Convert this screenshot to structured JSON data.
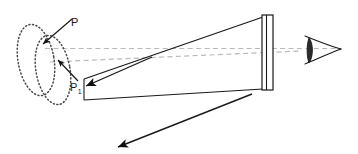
{
  "figure": {
    "kind": "optics-ray-diagram",
    "width": 358,
    "height": 154,
    "background_color": "#ffffff",
    "stroke_color": "#1a1a1a",
    "dashed_axis_color": "#b4b4b4",
    "dotted_ellipse_color": "#4d4d4d"
  },
  "labels": {
    "point_p": "P",
    "point_p1_base": "P",
    "point_p1_subscript": "1"
  },
  "elements": {
    "ellipse_back_name": "back wavefront ellipse",
    "ellipse_front_name": "front wavefront ellipse",
    "cone_name": "light cone",
    "screen_name": "screen plate",
    "eye_name": "observer eye",
    "ray_upper_name": "upper ray arrow",
    "ray_lower_name": "lower ray arrow",
    "axis_upper_name": "upper optical axis",
    "axis_lower_name": "lower optical axis",
    "pointer_p_name": "pointer to P",
    "pointer_p1_name": "pointer to P1"
  },
  "geometry": {
    "ellipse_back": {
      "cx": 37,
      "cy": 62,
      "rx": 20,
      "ry": 37,
      "rotate": -12
    },
    "ellipse_front": {
      "cx": 54,
      "cy": 70,
      "rx": 18,
      "ry": 35,
      "rotate": -12
    },
    "screen_outer": {
      "x": 262,
      "y": 14,
      "width": 12,
      "height": 76
    },
    "screen_inner_x": 266,
    "cone_top_left": {
      "x": 84,
      "y": 78
    },
    "cone_top_right": {
      "x": 262,
      "y": 17
    },
    "cone_bottom_left": {
      "x": 84,
      "y": 100
    },
    "cone_bottom_right": {
      "x": 262,
      "y": 89
    },
    "axis_upper": {
      "x1": 47,
      "y1": 49,
      "x2": 330,
      "y2": 49
    },
    "axis_lower": {
      "x1": 52,
      "y1": 61,
      "x2": 312,
      "y2": 52
    },
    "ray_upper": {
      "x1": 150,
      "y1": 58,
      "x2": 85,
      "y2": 86
    },
    "ray_lower": {
      "x1": 250,
      "y1": 95,
      "x2": 118,
      "y2": 148
    },
    "eye_center": {
      "x": 313,
      "y": 50
    }
  }
}
